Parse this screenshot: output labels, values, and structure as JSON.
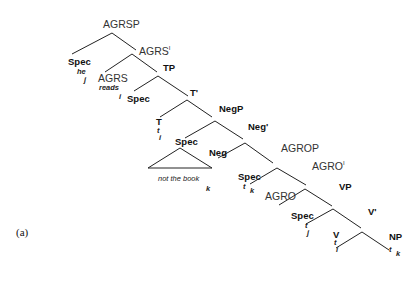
{
  "caption": "(a)",
  "nodes": {
    "agrsp": "AGRSP",
    "spec_subj": "Spec",
    "spec_subj_word": "he",
    "spec_subj_index": "j",
    "agrs_bar": "AGRS",
    "agrs_bar_sup": "I",
    "agrs": "AGRS",
    "agrs_word": "reads",
    "agrs_index": "i",
    "tp": "TP",
    "spec_tp": "Spec",
    "t_bar": "T'",
    "t": "T",
    "t_trace": "t",
    "t_trace_index": "i",
    "negp": "NegP",
    "spec_neg": "Spec",
    "spec_neg_phrase": "not the book",
    "spec_neg_index": "k",
    "neg_bar": "Neg'",
    "neg": "Neg",
    "agrop": "AGROP",
    "spec_agro": "Spec",
    "spec_agro_trace": "t",
    "spec_agro_index": "k",
    "agro_bar": "AGRO",
    "agro_bar_sup": "I",
    "agro": "AGRO",
    "vp": "VP",
    "spec_vp": "Spec",
    "spec_vp_trace": "t",
    "spec_vp_index": "j",
    "v_bar": "V'",
    "v": "V",
    "v_trace": "t",
    "v_trace_index": "i",
    "np": "NP",
    "np_trace": "t",
    "np_trace_index": "k"
  }
}
